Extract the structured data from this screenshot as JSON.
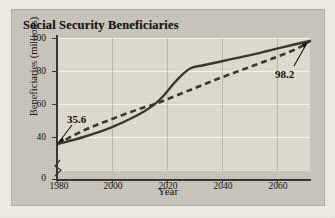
{
  "figure": {
    "title": "Social Security Beneficiaries",
    "panel_color": "#c8c4ba",
    "plot_color": "#ddd7c9",
    "gridline_color": "#f6f2e9",
    "axis_color": "#3a352d",
    "line_color": "#3d382f"
  },
  "chart_data": {
    "type": "line",
    "title": "Social Security Beneficiaries",
    "xlabel": "Year",
    "ylabel": "Beneficiaries (millions)",
    "xlim": [
      1980,
      2075
    ],
    "ylim": [
      0,
      100
    ],
    "y_axis_break": true,
    "y_ticks": [
      0,
      40,
      60,
      80,
      100
    ],
    "x_ticks": [
      1980,
      2000,
      2020,
      2040,
      2060
    ],
    "grid": "horizontal",
    "legend": "none",
    "annotations": [
      {
        "label": "35.6",
        "x": 1980,
        "y": 35.6,
        "note": "starting value at 1980"
      },
      {
        "label": "98.2",
        "x": 2075,
        "y": 98.2,
        "note": "ending value at right edge"
      }
    ],
    "series": [
      {
        "name": "Actual / projected beneficiaries",
        "style": "solid",
        "x": [
          1980,
          1990,
          2000,
          2010,
          2016,
          2020,
          2025,
          2030,
          2035,
          2045,
          2055,
          2065,
          2075
        ],
        "values": [
          35.6,
          40.0,
          45.5,
          53.0,
          59.0,
          65.0,
          74.5,
          81.5,
          83.5,
          87.0,
          90.5,
          94.5,
          98.2
        ]
      },
      {
        "name": "Linear trend",
        "style": "dashed",
        "x": [
          1980,
          1990,
          2000,
          2010,
          2016,
          2020,
          2030,
          2040,
          2050,
          2060,
          2070,
          2075
        ],
        "values": [
          35.6,
          44.0,
          50.5,
          56.5,
          59.5,
          62.0,
          68.5,
          75.0,
          81.0,
          87.0,
          93.5,
          98.2
        ]
      }
    ]
  }
}
